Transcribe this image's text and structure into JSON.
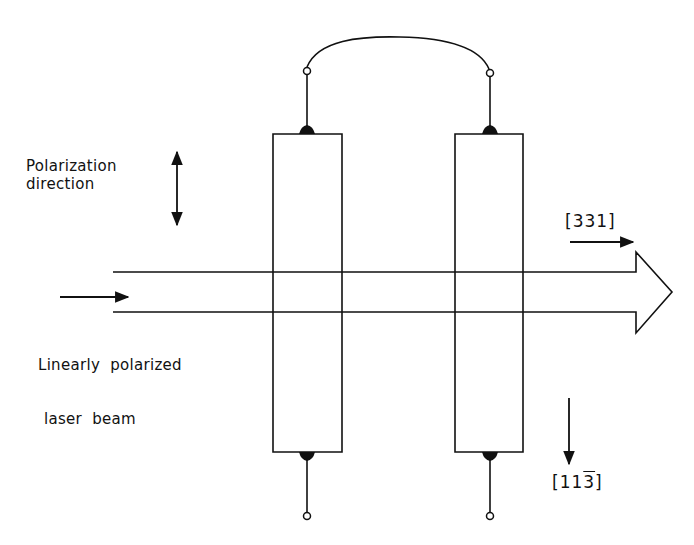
{
  "figure": {
    "type": "schematic",
    "background": "#ffffff",
    "stroke_color": "#111111"
  },
  "labels": {
    "polarization": {
      "line1": "Polarization",
      "line2": "direction",
      "icon": "double-headed-vertical-arrow-icon"
    },
    "beam": {
      "line1": "Linearly  polarized",
      "line2": "laser  beam",
      "icon": "right-arrow-icon"
    },
    "direction_331": {
      "text": "[331]",
      "icon": "right-arrow-icon"
    },
    "direction_113bar": {
      "prefix": "[11",
      "overbar_digit": "3",
      "suffix": "]",
      "icon": "down-arrow-icon"
    }
  },
  "components": {
    "crystals": [
      {
        "name": "left-crystal",
        "x": 273,
        "y": 134,
        "width": 69,
        "height": 318
      },
      {
        "name": "right-crystal",
        "x": 455,
        "y": 134,
        "width": 68,
        "height": 318
      }
    ],
    "beam": {
      "x_start": 113,
      "x_end": 636,
      "y_top": 272,
      "y_bottom": 312,
      "arrowhead_tip_x": 672,
      "arrowhead_top_y": 252,
      "arrowhead_bottom_y": 333
    }
  }
}
